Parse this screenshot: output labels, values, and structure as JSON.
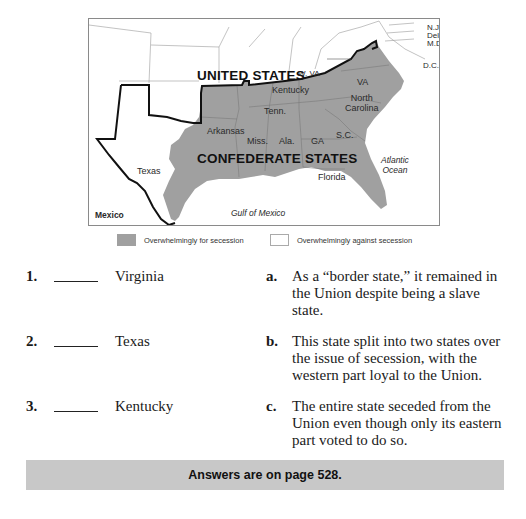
{
  "map": {
    "labels": {
      "united_states": "UNITED STATES",
      "confederate_states": "CONFEDERATE STATES",
      "kentucky": "Kentucky",
      "w_va": "W. VA",
      "va": "VA",
      "north_carolina": "North\nCarolina",
      "tenn": "Tenn.",
      "arkansas": "Arkansas",
      "miss": "Miss.",
      "ala": "Ala.",
      "ga": "GA",
      "sc": "S.C.",
      "florida": "Florida",
      "texas": "Texas",
      "mexico": "Mexico",
      "gulf": "Gulf of Mexico",
      "atlantic": "Atlantic\nOcean",
      "nj": "N.J.",
      "del": "Del.",
      "md": "M.D.",
      "dc": "D.C."
    },
    "colors": {
      "for_secession": "#a0a0a0",
      "against_secession": "#ffffff",
      "border": "#111111",
      "state_lines": "#9a9a9a"
    }
  },
  "legend": {
    "items": [
      {
        "label": "Overwhelmingly for secession",
        "swatch": "gray"
      },
      {
        "label": "Overwhelmingly against secession",
        "swatch": "white"
      }
    ]
  },
  "questions": [
    {
      "number": "1.",
      "term": "Virginia"
    },
    {
      "number": "2.",
      "term": "Texas"
    },
    {
      "number": "3.",
      "term": "Kentucky"
    }
  ],
  "choices": [
    {
      "letter": "a.",
      "text": "As a “border state,” it remained in the Union despite being a slave state."
    },
    {
      "letter": "b.",
      "text": "This state split into two states over the issue of secession, with the western part loyal to the Union."
    },
    {
      "letter": "c.",
      "text": "The entire state seceded from the Union even though only its eastern part voted to do so."
    }
  ],
  "footer": {
    "answers_note": "Answers are on page 528."
  }
}
